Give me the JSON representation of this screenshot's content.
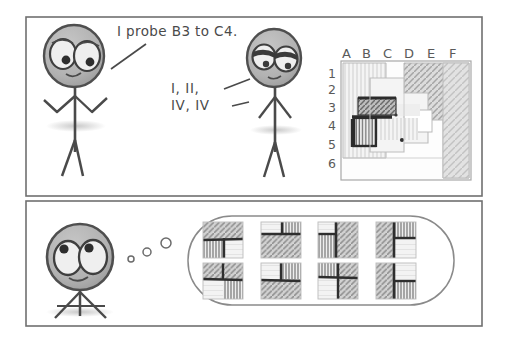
{
  "comic": {
    "title": "Battleship-style stick figure comic",
    "style": "hand-drawn pencil sketch, grayscale",
    "panel_count": 2,
    "paper_color": "#ffffff",
    "ink_color": "#5a5a5a",
    "panel_border_color": "#6b6b6b"
  },
  "panels": [
    {
      "id": "panel-top",
      "name": "top-panel",
      "x": 26,
      "y": 17,
      "width": 456,
      "height": 179,
      "characters": [
        {
          "id": "speaker-left",
          "name": "left-stick-figure",
          "pose": "arms out, standing",
          "expression": "wide open eyes",
          "head_cx": 74,
          "head_cy": 56,
          "head_rx": 30,
          "head_ry": 31
        },
        {
          "id": "speaker-right",
          "name": "right-stick-figure",
          "pose": "arms down, standing",
          "expression": "half-lidded skeptical eyes",
          "head_cx": 274,
          "head_cy": 58,
          "head_rx": 27,
          "head_ry": 29
        }
      ],
      "speech": [
        {
          "id": "speech-1",
          "name": "speech-text-probe",
          "text": "I probe B3 to C4.",
          "x": 117,
          "y": 24,
          "pointer_from": [
            143,
            47
          ],
          "pointer_to": [
            110,
            68
          ]
        },
        {
          "id": "speech-2",
          "name": "speech-text-roman",
          "line1": "I, II,",
          "line2": "IV, IV",
          "x": 170,
          "y": 82,
          "pointer_from": [
            228,
            90
          ],
          "pointer_to": [
            253,
            78
          ]
        }
      ],
      "board": {
        "id": "game-board",
        "name": "game-board",
        "x": 341,
        "y": 60,
        "width": 130,
        "height": 120,
        "columns": [
          "A",
          "B",
          "C",
          "D",
          "E",
          "F"
        ],
        "rows": [
          "1",
          "2",
          "3",
          "4",
          "5",
          "6"
        ],
        "column_label_y": 54,
        "row_label_x": 330,
        "regions": [
          {
            "name": "territory-left-vertical-hatch",
            "fill": "#ebebeb",
            "hatch": "vertical",
            "x": 0,
            "y": 2,
            "w": 44,
            "h": 105
          },
          {
            "name": "territory-right-diagonal-hatch",
            "fill": "#d8d8d8",
            "hatch": "diagonal",
            "x": 82,
            "y": 2,
            "w": 48,
            "h": 118
          },
          {
            "name": "territory-center-light",
            "fill": "#f2f2f2",
            "hatch": "none",
            "x": 30,
            "y": 18,
            "w": 62,
            "h": 80
          },
          {
            "name": "marked-cell-B3",
            "fill": "#b8b8b8",
            "hatch": "diagonal-dark",
            "x": 18,
            "y": 38,
            "w": 36,
            "h": 18
          },
          {
            "name": "marked-cell-C4",
            "fill": "#f0f0f0",
            "hatch": "vertical-dark",
            "x": 14,
            "y": 58,
            "w": 22,
            "h": 28
          }
        ]
      }
    },
    {
      "id": "panel-bottom",
      "name": "bottom-panel",
      "x": 26,
      "y": 201,
      "width": 456,
      "height": 125,
      "characters": [
        {
          "id": "thinker",
          "name": "thinking-stick-figure",
          "pose": "seated / tripod legs",
          "expression": "wide thoughtful eyes",
          "head_cx": 80,
          "head_cy": 257,
          "head_rx": 33,
          "head_ry": 33
        }
      ],
      "thought_bubble": {
        "id": "thought-bubble",
        "name": "thought-bubble",
        "x": 188,
        "y": 215,
        "width": 266,
        "height": 90,
        "dots": [
          {
            "cx": 131,
            "cy": 258,
            "r": 3.0
          },
          {
            "cx": 147,
            "cy": 252,
            "r": 4.0
          },
          {
            "cx": 166,
            "cy": 244,
            "r": 5.0
          }
        ],
        "tile_grid": {
          "name": "imagined-board-variants",
          "rows": 2,
          "cols": 4,
          "tile_count": 8,
          "tile_size": 40,
          "description": "eight small 2x2 quadrant boards with differing hatch arrangements",
          "tiles": [
            {
              "name": "variant-1",
              "quadrants": [
                "diag",
                "diag",
                "vert",
                "blank"
              ]
            },
            {
              "name": "variant-2",
              "quadrants": [
                "blank",
                "vert",
                "diag",
                "diag"
              ]
            },
            {
              "name": "variant-3",
              "quadrants": [
                "blank",
                "diag",
                "vert",
                "diag"
              ]
            },
            {
              "name": "variant-4",
              "quadrants": [
                "diag",
                "vert",
                "diag",
                "blank"
              ]
            },
            {
              "name": "variant-5",
              "quadrants": [
                "diag",
                "diag",
                "blank",
                "vert"
              ]
            },
            {
              "name": "variant-6",
              "quadrants": [
                "blank",
                "vert",
                "diag",
                "diag"
              ]
            },
            {
              "name": "variant-7",
              "quadrants": [
                "vert",
                "diag",
                "blank",
                "diag"
              ]
            },
            {
              "name": "variant-8",
              "quadrants": [
                "diag",
                "blank",
                "vert",
                "diag"
              ]
            }
          ]
        }
      }
    }
  ],
  "colors": {
    "ink": "#5a5a5a",
    "ink_dark": "#3a3a3a",
    "head_fill": "#b4b4b4",
    "eye_white": "#efefef",
    "panel_border": "#707070",
    "hatch_light": "#eeeeee",
    "hatch_mid": "#d6d6d6",
    "hatch_dark": "#9a9a9a",
    "board_outline": "#9d9d9d"
  }
}
